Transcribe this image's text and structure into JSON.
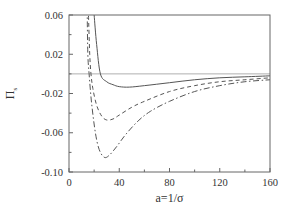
{
  "chart_data": {
    "type": "line",
    "title": "",
    "xlabel": "a=1/σ",
    "ylabel": "Π",
    "ylabel_subscript": "s",
    "xlim": [
      0,
      160
    ],
    "ylim": [
      -0.1,
      0.06
    ],
    "x_ticks": [
      0,
      40,
      80,
      120,
      160
    ],
    "x_tick_labels": [
      "0",
      "40",
      "80",
      "120",
      "160"
    ],
    "x_minor_ticks": [
      20,
      60,
      100,
      140
    ],
    "y_ticks": [
      0.06,
      0.02,
      -0.02,
      -0.06,
      -0.1
    ],
    "y_tick_labels": [
      "0.06",
      "0.02",
      "-0.02",
      "-0.06",
      "-0.10"
    ],
    "y_minor_ticks": [
      0.04,
      0.0,
      -0.04,
      -0.08
    ],
    "grid": false,
    "legend": null,
    "reference_lines": [
      {
        "axis": "y",
        "value": 0.0,
        "style": "thin-solid",
        "color": "#999999"
      }
    ],
    "series": [
      {
        "name": "solid",
        "style": "solid",
        "color": "#555555",
        "x": [
          20,
          22,
          25,
          30,
          35,
          40,
          48,
          60,
          80,
          100,
          120,
          140,
          160
        ],
        "y": [
          0.06,
          0.03,
          0.0,
          -0.008,
          -0.011,
          -0.013,
          -0.0135,
          -0.012,
          -0.009,
          -0.006,
          -0.004,
          -0.003,
          -0.002
        ]
      },
      {
        "name": "dashed",
        "style": "dashed",
        "color": "#555555",
        "x": [
          15.5,
          16.5,
          17.5,
          19,
          22,
          26,
          30,
          35,
          40,
          50,
          60,
          80,
          100,
          120,
          140,
          160
        ],
        "y": [
          0.06,
          0.02,
          0.0,
          -0.015,
          -0.032,
          -0.043,
          -0.047,
          -0.046,
          -0.042,
          -0.034,
          -0.028,
          -0.018,
          -0.012,
          -0.008,
          -0.006,
          -0.004
        ]
      },
      {
        "name": "dash-dot",
        "style": "dash-dot",
        "color": "#555555",
        "x": [
          14.5,
          15,
          16,
          18,
          21,
          24,
          28,
          32,
          38,
          45,
          55,
          65,
          80,
          100,
          120,
          140,
          160
        ],
        "y": [
          0.06,
          0.02,
          0.0,
          -0.03,
          -0.06,
          -0.077,
          -0.085,
          -0.083,
          -0.074,
          -0.062,
          -0.048,
          -0.038,
          -0.028,
          -0.018,
          -0.012,
          -0.008,
          -0.006
        ]
      }
    ]
  },
  "layout": {
    "plot": {
      "left": 69,
      "top": 15,
      "right": 270,
      "bottom": 172
    },
    "frame_color": "#666666"
  }
}
